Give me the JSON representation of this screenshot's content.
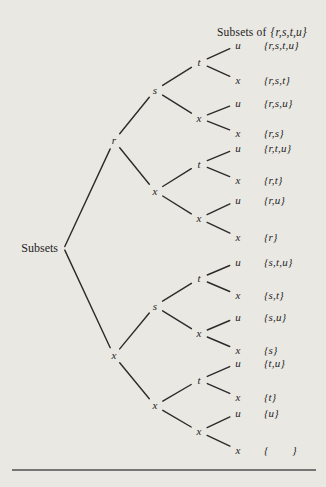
{
  "diagram": {
    "title_prefix": "Subsets of",
    "title_set": "{r,s,t,u}",
    "colors": {
      "paper": "#eae8e3",
      "ink": "#1e1e1e",
      "edge": "#2b2b2b",
      "rule": "#4f4f4f"
    },
    "tree": {
      "label": "Subsets",
      "children": [
        {
          "label": "r",
          "children": [
            {
              "label": "s",
              "children": [
                {
                  "label": "t",
                  "children": [
                    {
                      "label": "u",
                      "subset": "{r,s,t,u}"
                    },
                    {
                      "label": "x",
                      "subset": "{r,s,t}"
                    }
                  ]
                },
                {
                  "label": "x",
                  "children": [
                    {
                      "label": "u",
                      "subset": "{r,s,u}"
                    },
                    {
                      "label": "x",
                      "subset": "{r,s}"
                    }
                  ]
                }
              ]
            },
            {
              "label": "x",
              "children": [
                {
                  "label": "t",
                  "children": [
                    {
                      "label": "u",
                      "subset": "{r,t,u}"
                    },
                    {
                      "label": "x",
                      "subset": "{r,t}"
                    }
                  ]
                },
                {
                  "label": "x",
                  "children": [
                    {
                      "label": "u",
                      "subset": "{r,u}"
                    },
                    {
                      "label": "x",
                      "subset": "{r}"
                    }
                  ]
                }
              ]
            }
          ]
        },
        {
          "label": "x",
          "children": [
            {
              "label": "s",
              "children": [
                {
                  "label": "t",
                  "children": [
                    {
                      "label": "u",
                      "subset": "{s,t,u}"
                    },
                    {
                      "label": "x",
                      "subset": "{s,t}"
                    }
                  ]
                },
                {
                  "label": "x",
                  "children": [
                    {
                      "label": "u",
                      "subset": "{s,u}"
                    },
                    {
                      "label": "x",
                      "subset": "{s}"
                    }
                  ]
                }
              ]
            },
            {
              "label": "x",
              "children": [
                {
                  "label": "t",
                  "children": [
                    {
                      "label": "u",
                      "subset": "{t,u}"
                    },
                    {
                      "label": "x",
                      "subset": "{t}"
                    }
                  ]
                },
                {
                  "label": "x",
                  "children": [
                    {
                      "label": "u",
                      "subset": "{u}"
                    },
                    {
                      "label": "x",
                      "subset": "{        }"
                    }
                  ]
                }
              ]
            }
          ]
        }
      ]
    }
  }
}
